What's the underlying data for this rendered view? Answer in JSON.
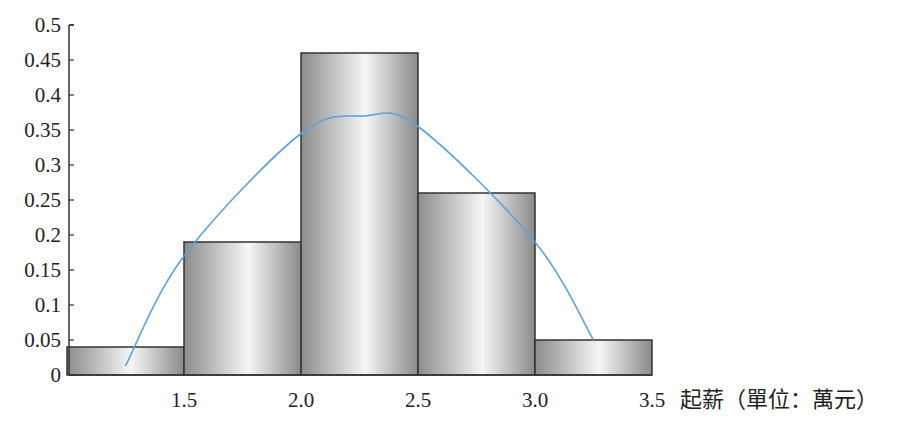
{
  "chart_data": {
    "type": "bar",
    "subtype": "histogram_with_density_curve",
    "title": "",
    "xlabel": "起薪（單位：萬元）",
    "ylabel": "",
    "bins": [
      {
        "start": 1.0,
        "end": 1.5,
        "value": 0.04
      },
      {
        "start": 1.5,
        "end": 2.0,
        "value": 0.19
      },
      {
        "start": 2.0,
        "end": 2.5,
        "value": 0.46
      },
      {
        "start": 2.5,
        "end": 3.0,
        "value": 0.26
      },
      {
        "start": 3.0,
        "end": 3.5,
        "value": 0.05
      }
    ],
    "categories": [
      "1.0-1.5",
      "1.5-2.0",
      "2.0-2.5",
      "2.5-3.0",
      "3.0-3.5"
    ],
    "values": [
      0.04,
      0.19,
      0.46,
      0.26,
      0.05
    ],
    "curve": {
      "type": "line",
      "description": "fitted smooth curve over histogram",
      "points": [
        {
          "x": 1.25,
          "y": 0.013
        },
        {
          "x": 1.5,
          "y": 0.17
        },
        {
          "x": 2.0,
          "y": 0.345
        },
        {
          "x": 2.27,
          "y": 0.37
        },
        {
          "x": 2.5,
          "y": 0.355
        },
        {
          "x": 3.0,
          "y": 0.19
        },
        {
          "x": 3.25,
          "y": 0.05
        }
      ],
      "color": "#5ba3d9"
    },
    "x_ticks": [
      "1.5",
      "2.0",
      "2.5",
      "3.0",
      "3.5"
    ],
    "y_ticks": [
      "0",
      "0.05",
      "0.1",
      "0.15",
      "0.2",
      "0.25",
      "0.3",
      "0.35",
      "0.4",
      "0.45",
      "0.5"
    ],
    "ylim": [
      0,
      0.5
    ],
    "xlim": [
      1.0,
      3.5
    ],
    "grid": false,
    "legend": null,
    "colors": {
      "bar_edge": "#333333",
      "bar_fill_dark": "#8c8c8c",
      "bar_fill_light": "#f4f4f4",
      "curve": "#5ba3d9"
    }
  }
}
